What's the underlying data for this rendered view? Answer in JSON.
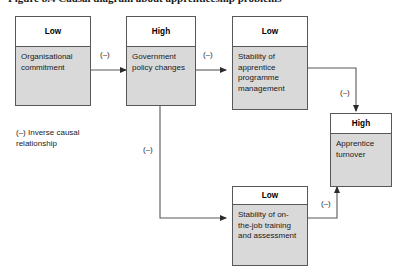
{
  "figure": {
    "caption": "Figure 8.4 Causal diagram about apprenticeship problems"
  },
  "nodes": [
    {
      "id": "organisational-commitment",
      "level": "Low",
      "label": "Organisational commitment"
    },
    {
      "id": "government-policy-changes",
      "level": "High",
      "label": "Government policy changes"
    },
    {
      "id": "stability-apprentice-programme-management",
      "level": "Low",
      "label": "Stability of apprentice programme management"
    },
    {
      "id": "apprentice-turnover",
      "level": "High",
      "label": "Apprentice turnover"
    },
    {
      "id": "stability-on-the-job-training",
      "level": "Low",
      "label": "Stability of on-the-job training and assessment"
    }
  ],
  "edges": [
    {
      "id": "edge-commitment-to-policy",
      "from": "organisational-commitment",
      "to": "government-policy-changes",
      "label": "(–)"
    },
    {
      "id": "edge-policy-to-programme-management",
      "from": "government-policy-changes",
      "to": "stability-apprentice-programme-management",
      "label": "(–)"
    },
    {
      "id": "edge-programme-management-to-turnover",
      "from": "stability-apprentice-programme-management",
      "to": "apprentice-turnover",
      "label": "(–)"
    },
    {
      "id": "edge-policy-to-onthejob-training",
      "from": "government-policy-changes",
      "to": "stability-on-the-job-training",
      "label": "(–)"
    },
    {
      "id": "edge-onthejob-training-to-turnover",
      "from": "stability-on-the-job-training",
      "to": "apprentice-turnover",
      "label": "(–)"
    }
  ],
  "legend": {
    "symbol": "(–)",
    "text": "(–) Inverse causal relationship"
  },
  "colors": {
    "node_body_fill": "#d9d9d9",
    "node_header_fill": "#ffffff",
    "node_border": "#58585a",
    "connector": "#58585a",
    "text": "#1a1a1a"
  }
}
